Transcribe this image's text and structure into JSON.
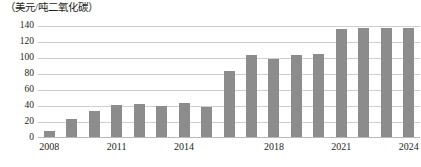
{
  "chart_data": {
    "type": "bar",
    "title": "（美元/吨二氧化碳）",
    "xlabel": "（年份）",
    "ylabel": "",
    "unit_label": "（美元/吨二氧化碳）",
    "grid": true,
    "legend": null,
    "ylim": [
      0,
      140
    ],
    "yticks": [
      0,
      20,
      40,
      60,
      80,
      100,
      120,
      140
    ],
    "ytick_labels": [
      "0",
      "20",
      "40",
      "60",
      "80",
      "100",
      "120",
      "140"
    ],
    "categories": [
      "2008",
      "2009",
      "2010",
      "2011",
      "2012",
      "2013",
      "2014",
      "2015",
      "2016",
      "2017",
      "2018",
      "2019",
      "2020",
      "2021",
      "2022",
      "2023",
      "2024"
    ],
    "xtick_labels": [
      "2008",
      "2011",
      "2014",
      "2018",
      "2021",
      "2024"
    ],
    "xtick_categories": [
      "2008",
      "2011",
      "2014",
      "2018",
      "2021",
      "2024"
    ],
    "values": [
      8,
      22,
      33,
      40,
      41,
      39,
      42,
      38,
      83,
      103,
      98,
      102,
      104,
      135,
      136,
      136,
      136
    ],
    "bar_color": "#8c8c8c",
    "grid_color": "#cfcfcf",
    "axis_color": "#b9b9b9"
  }
}
